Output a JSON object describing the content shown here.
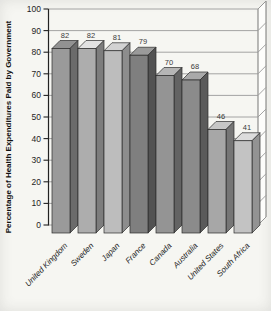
{
  "figure": {
    "background": "#f6f6f2",
    "wall_fill": "#fdfdfb"
  },
  "chart_data": {
    "type": "bar",
    "title": "",
    "xlabel": "",
    "ylabel": "Percentage of Health Expenditures Paid by Government",
    "categories": [
      "United Kingdom",
      "Sweden",
      "Japan",
      "France",
      "Canada",
      "Australia",
      "United States",
      "South Africa"
    ],
    "values": [
      82,
      82,
      81,
      79,
      70,
      68,
      46,
      41
    ],
    "ylim": [
      0,
      100
    ],
    "yticks": [
      0,
      10,
      20,
      30,
      40,
      50,
      60,
      70,
      80,
      90,
      100
    ],
    "grid": true,
    "legend": "none",
    "style": "3d-grayscale-bars",
    "axis_color": "#222222",
    "grid_color": "#9a9a9a",
    "tick_label_color": "#1e1e1e",
    "value_label_color": "#3a3a3a",
    "x_label_color": "#1e1e1e",
    "bar_colors": [
      {
        "front": "#9a9a9a",
        "top": "#929292",
        "side": "#6b6b6b"
      },
      {
        "front": "#adadad",
        "top": "#e2e2e2",
        "side": "#7d7d7d"
      },
      {
        "front": "#bdbdbd",
        "top": "#d2d2d2",
        "side": "#8d8d8d"
      },
      {
        "front": "#7f7f7f",
        "top": "#9a9a9a",
        "side": "#525252"
      },
      {
        "front": "#949494",
        "top": "#b5b5b5",
        "side": "#636363"
      },
      {
        "front": "#8b8b8b",
        "top": "#a9a9a9",
        "side": "#5a5a5a"
      },
      {
        "front": "#a7a7a7",
        "top": "#c6c6c6",
        "side": "#767676"
      },
      {
        "front": "#c3c3c3",
        "top": "#dcdcdc",
        "side": "#939393"
      }
    ]
  }
}
